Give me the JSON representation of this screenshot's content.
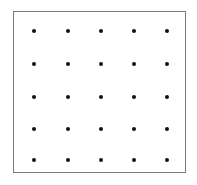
{
  "figure": {
    "title": "5 by 5 square dot lattice",
    "type": "dot-grid-diagram",
    "canvas": {
      "width": 197,
      "height": 185,
      "background": "#ffffff"
    },
    "frame": {
      "name": "bounding-square",
      "x": 13,
      "y": 11,
      "width": 173,
      "height": 162,
      "border_width": 1,
      "border_color": "#7a7a7a",
      "fill": "#ffffff",
      "shape": "rectangle"
    },
    "dots": {
      "rows": 5,
      "columns": 5,
      "count": 25,
      "color": "#111111",
      "diameter": 4,
      "shape": "circle",
      "column_x": [
        34,
        68,
        101,
        134,
        167
      ],
      "row_y": [
        31,
        64,
        97,
        129,
        160
      ],
      "column_spacing": 33,
      "row_spacing": 32,
      "points": [
        {
          "row": 1,
          "col": 1,
          "x": 34,
          "y": 31
        },
        {
          "row": 1,
          "col": 2,
          "x": 68,
          "y": 31
        },
        {
          "row": 1,
          "col": 3,
          "x": 101,
          "y": 31
        },
        {
          "row": 1,
          "col": 4,
          "x": 134,
          "y": 31
        },
        {
          "row": 1,
          "col": 5,
          "x": 167,
          "y": 31
        },
        {
          "row": 2,
          "col": 1,
          "x": 34,
          "y": 64
        },
        {
          "row": 2,
          "col": 2,
          "x": 68,
          "y": 64
        },
        {
          "row": 2,
          "col": 3,
          "x": 101,
          "y": 64
        },
        {
          "row": 2,
          "col": 4,
          "x": 134,
          "y": 64
        },
        {
          "row": 2,
          "col": 5,
          "x": 167,
          "y": 64
        },
        {
          "row": 3,
          "col": 1,
          "x": 34,
          "y": 97
        },
        {
          "row": 3,
          "col": 2,
          "x": 68,
          "y": 97
        },
        {
          "row": 3,
          "col": 3,
          "x": 101,
          "y": 97
        },
        {
          "row": 3,
          "col": 4,
          "x": 134,
          "y": 97
        },
        {
          "row": 3,
          "col": 5,
          "x": 167,
          "y": 97
        },
        {
          "row": 4,
          "col": 1,
          "x": 34,
          "y": 129
        },
        {
          "row": 4,
          "col": 2,
          "x": 68,
          "y": 129
        },
        {
          "row": 4,
          "col": 3,
          "x": 101,
          "y": 129
        },
        {
          "row": 4,
          "col": 4,
          "x": 134,
          "y": 129
        },
        {
          "row": 4,
          "col": 5,
          "x": 167,
          "y": 129
        },
        {
          "row": 5,
          "col": 1,
          "x": 34,
          "y": 160
        },
        {
          "row": 5,
          "col": 2,
          "x": 68,
          "y": 160
        },
        {
          "row": 5,
          "col": 3,
          "x": 101,
          "y": 160
        },
        {
          "row": 5,
          "col": 4,
          "x": 134,
          "y": 160
        },
        {
          "row": 5,
          "col": 5,
          "x": 167,
          "y": 160
        }
      ]
    }
  }
}
